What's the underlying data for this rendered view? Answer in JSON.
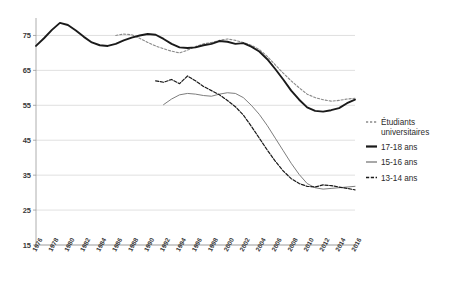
{
  "chart_data": {
    "type": "line",
    "title": "",
    "xlabel": "",
    "ylabel": "",
    "ylim": [
      15,
      80
    ],
    "ytick_values": [
      15,
      25,
      35,
      45,
      55,
      65,
      75
    ],
    "grid": true,
    "legend_position": "right",
    "x": [
      1976,
      1977,
      1978,
      1979,
      1980,
      1981,
      1982,
      1983,
      1984,
      1985,
      1986,
      1987,
      1988,
      1989,
      1990,
      1991,
      1992,
      1993,
      1994,
      1995,
      1996,
      1997,
      1998,
      1999,
      2000,
      2001,
      2002,
      2003,
      2004,
      2005,
      2006,
      2007,
      2008,
      2009,
      2010,
      2011,
      2012,
      2013,
      2014,
      2015,
      2016
    ],
    "xtick_labels": [
      "1976",
      "1978",
      "1980",
      "1982",
      "1984",
      "1986",
      "1988",
      "1990",
      "1992",
      "1994",
      "1996",
      "1998",
      "2000",
      "2002",
      "2004",
      "2006",
      "2008",
      "2010",
      "2012",
      "2014",
      "2016"
    ],
    "series": [
      {
        "name": "Étudiants universitaires",
        "style": "dotted",
        "color": "#8a8a8a",
        "width": 1.1,
        "x_start": 1986,
        "values": [
          null,
          null,
          null,
          null,
          null,
          null,
          null,
          null,
          null,
          null,
          75.0,
          75.4,
          75.2,
          74.2,
          73.0,
          72.0,
          71.2,
          70.5,
          70.0,
          70.8,
          71.8,
          72.6,
          73.0,
          73.6,
          74.0,
          73.6,
          73.0,
          72.2,
          71.0,
          69.0,
          66.6,
          64.2,
          62.0,
          60.0,
          58.2,
          57.2,
          56.6,
          56.2,
          56.4,
          56.8,
          57.0
        ]
      },
      {
        "name": "17-18 ans",
        "style": "solid",
        "color": "#1a1a1a",
        "width": 1.9,
        "x_start": 1976,
        "values": [
          72.0,
          74.2,
          76.6,
          78.6,
          78.0,
          76.4,
          74.6,
          73.0,
          72.2,
          72.0,
          72.6,
          73.6,
          74.4,
          75.0,
          75.4,
          75.2,
          74.0,
          72.6,
          71.6,
          71.4,
          71.6,
          72.2,
          72.6,
          73.4,
          73.2,
          72.6,
          72.8,
          71.8,
          70.4,
          68.2,
          65.4,
          62.4,
          59.2,
          56.6,
          54.4,
          53.4,
          53.2,
          53.6,
          54.2,
          55.6,
          56.6
        ]
      },
      {
        "name": "15-16 ans",
        "style": "solid-thin",
        "color": "#6e6e6e",
        "width": 0.9,
        "x_start": 1992,
        "values": [
          null,
          null,
          null,
          null,
          null,
          null,
          null,
          null,
          null,
          null,
          null,
          null,
          null,
          null,
          null,
          null,
          55.2,
          56.8,
          58.0,
          58.4,
          58.2,
          57.8,
          57.6,
          58.2,
          58.6,
          58.4,
          57.2,
          55.0,
          52.4,
          49.2,
          45.6,
          42.0,
          38.4,
          35.2,
          32.6,
          31.4,
          31.0,
          31.2,
          31.4,
          31.6,
          31.8
        ]
      },
      {
        "name": "13-14 ans",
        "style": "dashed",
        "color": "#1a1a1a",
        "width": 1.2,
        "x_start": 1991,
        "values": [
          null,
          null,
          null,
          null,
          null,
          null,
          null,
          null,
          null,
          null,
          null,
          null,
          null,
          null,
          null,
          62.0,
          61.6,
          62.4,
          61.2,
          63.4,
          62.0,
          60.4,
          59.2,
          58.0,
          56.4,
          54.6,
          52.2,
          49.0,
          45.6,
          42.2,
          39.0,
          36.2,
          34.0,
          32.6,
          31.8,
          31.6,
          32.2,
          32.0,
          31.6,
          31.2,
          30.8
        ]
      }
    ]
  },
  "legend": {
    "items": [
      {
        "label": "Étudiants",
        "label2": "universitaires",
        "key": "students"
      },
      {
        "label": "17-18 ans",
        "key": "age17"
      },
      {
        "label": "15-16 ans",
        "key": "age15"
      },
      {
        "label": "13-14 ans",
        "key": "age13"
      }
    ]
  }
}
